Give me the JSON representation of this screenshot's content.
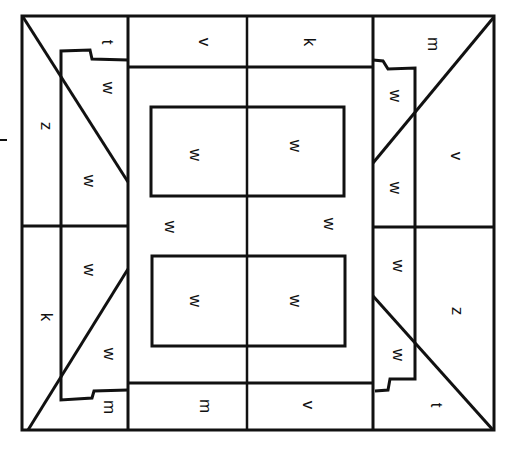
{
  "diagram": {
    "type": "floor-plan-tile-layout",
    "text_rotation_deg": 90,
    "stroke_color": "#111111",
    "background": "#ffffff",
    "labels": [
      {
        "id": "tl-corner",
        "text": "t",
        "x": 108,
        "y": 42
      },
      {
        "id": "top-left-band",
        "text": "v",
        "x": 205,
        "y": 42
      },
      {
        "id": "top-right-band",
        "text": "k",
        "x": 310,
        "y": 42
      },
      {
        "id": "tr-corner",
        "text": "m",
        "x": 434,
        "y": 44
      },
      {
        "id": "left-upper-outer",
        "text": "z",
        "x": 47,
        "y": 126
      },
      {
        "id": "left-upper-inner-top",
        "text": "w",
        "x": 109,
        "y": 88
      },
      {
        "id": "left-upper-inner-bottom",
        "text": "w",
        "x": 90,
        "y": 181
      },
      {
        "id": "upper-rect-left",
        "text": "w",
        "x": 196,
        "y": 155
      },
      {
        "id": "upper-rect-right",
        "text": "w",
        "x": 296,
        "y": 146
      },
      {
        "id": "right-upper-inner-top",
        "text": "w",
        "x": 396,
        "y": 96
      },
      {
        "id": "right-upper-inner-bottom",
        "text": "w",
        "x": 396,
        "y": 188
      },
      {
        "id": "right-upper-outer",
        "text": "v",
        "x": 457,
        "y": 156
      },
      {
        "id": "center-left",
        "text": "w",
        "x": 171,
        "y": 227
      },
      {
        "id": "center-right",
        "text": "w",
        "x": 330,
        "y": 224
      },
      {
        "id": "left-lower-inner-top",
        "text": "w",
        "x": 90,
        "y": 270
      },
      {
        "id": "left-lower-outer",
        "text": "k",
        "x": 47,
        "y": 317
      },
      {
        "id": "left-lower-inner-bottom",
        "text": "w",
        "x": 110,
        "y": 354
      },
      {
        "id": "lower-rect-left",
        "text": "w",
        "x": 196,
        "y": 301
      },
      {
        "id": "lower-rect-right",
        "text": "w",
        "x": 296,
        "y": 301
      },
      {
        "id": "right-lower-inner-top",
        "text": "w",
        "x": 399,
        "y": 266
      },
      {
        "id": "right-lower-outer",
        "text": "z",
        "x": 458,
        "y": 311
      },
      {
        "id": "right-lower-inner-bottom",
        "text": "w",
        "x": 399,
        "y": 355
      },
      {
        "id": "bl-corner",
        "text": "m",
        "x": 110,
        "y": 407
      },
      {
        "id": "bottom-left-band",
        "text": "m",
        "x": 206,
        "y": 406
      },
      {
        "id": "bottom-right-band",
        "text": "v",
        "x": 309,
        "y": 405
      },
      {
        "id": "br-corner",
        "text": "t",
        "x": 437,
        "y": 405
      }
    ]
  }
}
